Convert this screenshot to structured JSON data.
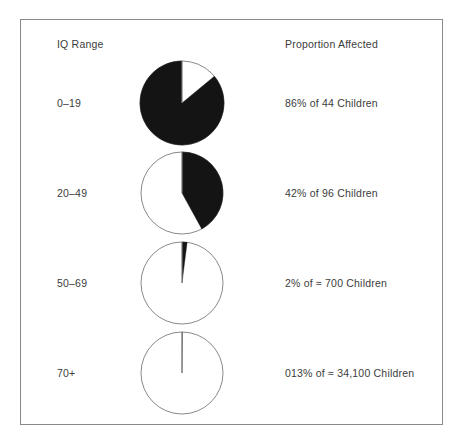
{
  "figure": {
    "headers": {
      "left": "IQ Range",
      "right": "Proportion Affected"
    },
    "border_color": "#8a8a8a",
    "slice_color": "#141414",
    "background_color": "#ffffff",
    "text_color": "#3c3c3c"
  },
  "rows": [
    {
      "iq_range": "0–19",
      "proportion": "86% of 44 Children",
      "percent": 86,
      "population": "44",
      "pie": {
        "filled_percent": 86,
        "direction": "counterclockwise",
        "start": "12 o'clock",
        "radius": 42
      }
    },
    {
      "iq_range": "20–49",
      "proportion": "42% of 96 Children",
      "percent": 42,
      "population": "96",
      "pie": {
        "filled_percent": 42,
        "direction": "clockwise",
        "start": "12 o'clock",
        "radius": 41
      }
    },
    {
      "iq_range": "50–69",
      "proportion": "2% of ≈ 700 Children",
      "percent": 2,
      "population": "≈ 700",
      "pie": {
        "filled_percent": 2,
        "direction": "clockwise",
        "start": "12 o'clock",
        "radius": 41
      }
    },
    {
      "iq_range": "70+",
      "proportion": "013% of ≈ 34,100 Children",
      "percent": 0.13,
      "population": "≈ 34,100",
      "pie": {
        "filled_percent": 0.13,
        "direction": "clockwise",
        "start": "12 o'clock",
        "radius": 41
      }
    }
  ],
  "chart_data": {
    "type": "pie",
    "title": "",
    "subtitle": "",
    "xlabel": "IQ Range",
    "ylabel": "Proportion Affected",
    "grid": false,
    "legend": "none",
    "panels": [
      {
        "label": "0–19",
        "slices": [
          {
            "name": "Affected",
            "value": 86,
            "color": "#141414"
          },
          {
            "name": "Unaffected",
            "value": 14,
            "color": "#ffffff"
          }
        ],
        "annotation": "86% of 44 Children",
        "denominator": 44
      },
      {
        "label": "20–49",
        "slices": [
          {
            "name": "Affected",
            "value": 42,
            "color": "#141414"
          },
          {
            "name": "Unaffected",
            "value": 58,
            "color": "#ffffff"
          }
        ],
        "annotation": "42% of 96 Children",
        "denominator": 96
      },
      {
        "label": "50–69",
        "slices": [
          {
            "name": "Affected",
            "value": 2,
            "color": "#141414"
          },
          {
            "name": "Unaffected",
            "value": 98,
            "color": "#ffffff"
          }
        ],
        "annotation": "2% of ≈ 700 Children",
        "denominator": 700
      },
      {
        "label": "70+",
        "slices": [
          {
            "name": "Affected",
            "value": 0.13,
            "color": "#141414"
          },
          {
            "name": "Unaffected",
            "value": 99.87,
            "color": "#ffffff"
          }
        ],
        "annotation": "013% of ≈ 34,100 Children",
        "denominator": 34100
      }
    ]
  }
}
